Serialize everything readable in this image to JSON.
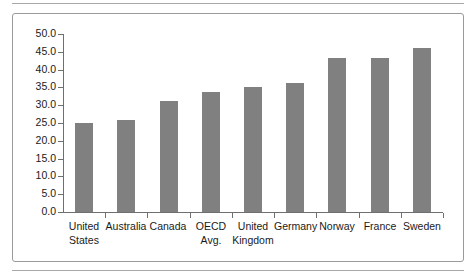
{
  "figure": {
    "frame_border_color": "#9a9a9a",
    "rule_color": "#a8a8a8",
    "background": "#ffffff"
  },
  "chart_data": {
    "type": "bar",
    "title": "",
    "subtitle": "",
    "xlabel": "",
    "ylabel": "",
    "categories": [
      "United\nStates",
      "Australia",
      "Canada",
      "OECD\nAvg.",
      "United\nKingdom",
      "Germany",
      "Norway",
      "France",
      "Sweden"
    ],
    "values": [
      24.9,
      25.9,
      31.1,
      33.8,
      35.0,
      36.3,
      43.2,
      43.2,
      46.1
    ],
    "ylim": [
      0.0,
      50.0
    ],
    "ytick_step": 5.0,
    "ytick_labels": [
      "50.0",
      "45.0",
      "40.0",
      "35.0",
      "30.0",
      "25.0",
      "20.0",
      "15.0",
      "10.0",
      "5.0",
      "0.0"
    ],
    "ytick_values": [
      50,
      45,
      40,
      35,
      30,
      25,
      20,
      15,
      10,
      5,
      0
    ],
    "grid": false,
    "legend": null,
    "legend_position": "none",
    "bar_color": "#808080",
    "axis_color": "#6f6f6f"
  }
}
